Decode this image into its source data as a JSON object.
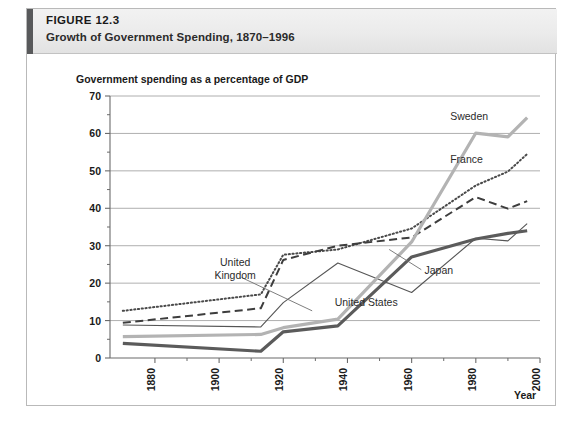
{
  "figure": {
    "number_prefix": "F",
    "number_label": "IGURE 12.3",
    "number_full": "FIGURE 12.3",
    "caption": "Growth of Government Spending, 1870–1996",
    "accent_color": "#58595b"
  },
  "chart_data": {
    "type": "line",
    "title": "Growth of Government Spending, 1870–1996",
    "subtitle": "Government spending as a percentage of GDP",
    "ylabel": "Government spending as a percentage of GDP",
    "xlabel": "Year",
    "grid": true,
    "legend_position": "inline-annotations",
    "xlim": [
      1866,
      2000
    ],
    "ylim": [
      0,
      70
    ],
    "yticks": [
      0,
      10,
      20,
      30,
      40,
      50,
      60,
      70
    ],
    "yminorticks": [
      5,
      15,
      25,
      35,
      45,
      55,
      65
    ],
    "xticks": [
      1880,
      1900,
      1920,
      1940,
      1960,
      1980,
      2000
    ],
    "xtick_labels": [
      "1880",
      "1900",
      "1920",
      "1940",
      "1960",
      "1980",
      "2000"
    ],
    "xtick_rotation": -90,
    "x": [
      1870,
      1913,
      1920,
      1937,
      1960,
      1980,
      1990,
      1996
    ],
    "series": [
      {
        "name": "France",
        "style": "dotted",
        "color": "#4a4a4a",
        "label": "France",
        "values": [
          12.6,
          17.0,
          27.6,
          29.0,
          34.6,
          46.1,
          49.8,
          54.5
        ]
      },
      {
        "name": "United Kingdom",
        "style": "dashed",
        "color": "#3d3d3d",
        "label": "United Kingdom",
        "values": [
          9.4,
          13.3,
          26.2,
          30.0,
          32.2,
          43.0,
          39.9,
          41.9
        ]
      },
      {
        "name": "Japan",
        "style": "thin-solid",
        "color": "#555555",
        "label": "Japan",
        "values": [
          8.8,
          8.3,
          14.8,
          25.4,
          17.5,
          32.0,
          31.3,
          35.9
        ]
      },
      {
        "name": "Sweden",
        "style": "thick-light",
        "color": "#b3b3b3",
        "label": "Sweden",
        "values": [
          5.7,
          6.3,
          8.1,
          10.4,
          31.0,
          60.1,
          59.1,
          64.2
        ]
      },
      {
        "name": "United States",
        "style": "thick-dark",
        "color": "#5b5b5b",
        "label": "United States",
        "values": [
          3.9,
          1.8,
          7.0,
          8.6,
          27.0,
          31.8,
          33.3,
          34.0
        ]
      }
    ],
    "annotations": [
      {
        "text": "Sweden",
        "x": 1972,
        "y": 63.5
      },
      {
        "text": "France",
        "x": 1972,
        "y": 52.0
      },
      {
        "text": "United Kingdom",
        "x": 1905,
        "y": 24.5
      },
      {
        "text": "Japan",
        "x": 1964,
        "y": 22.5
      },
      {
        "text": "United States",
        "x": 1936,
        "y": 14.0
      }
    ]
  }
}
